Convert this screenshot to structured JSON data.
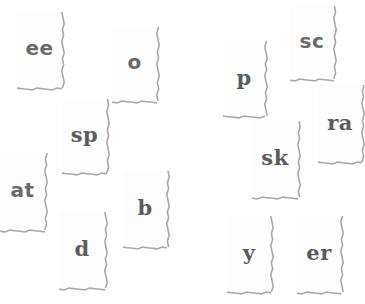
{
  "game": {
    "type": "word-fragment tiles",
    "tile_count": 13
  },
  "tiles": [
    {
      "id": "ee",
      "text": "ee",
      "x": 17,
      "y": 12,
      "w": 45,
      "h": 76
    },
    {
      "id": "o",
      "text": "o",
      "x": 112,
      "y": 27,
      "w": 45,
      "h": 74
    },
    {
      "id": "sp",
      "text": "sp",
      "x": 62,
      "y": 99,
      "w": 45,
      "h": 74
    },
    {
      "id": "at",
      "text": "at",
      "x": 0,
      "y": 153,
      "w": 45,
      "h": 77
    },
    {
      "id": "b",
      "text": "b",
      "x": 123,
      "y": 171,
      "w": 44,
      "h": 76
    },
    {
      "id": "d",
      "text": "d",
      "x": 59,
      "y": 212,
      "w": 46,
      "h": 76
    },
    {
      "id": "p",
      "text": "p",
      "x": 223,
      "y": 41,
      "w": 42,
      "h": 75
    },
    {
      "id": "sc",
      "text": "sc",
      "x": 290,
      "y": 6,
      "w": 44,
      "h": 73
    },
    {
      "id": "ra",
      "text": "ra",
      "x": 318,
      "y": 85,
      "w": 44,
      "h": 77
    },
    {
      "id": "sk",
      "text": "sk",
      "x": 252,
      "y": 121,
      "w": 46,
      "h": 76
    },
    {
      "id": "y",
      "text": "y",
      "x": 227,
      "y": 216,
      "w": 44,
      "h": 76
    },
    {
      "id": "er",
      "text": "er",
      "x": 297,
      "y": 216,
      "w": 44,
      "h": 76
    }
  ],
  "colors": {
    "background": "#ffffff",
    "tile": "#fdfdfd",
    "edge_shadow": "#a8a8a8",
    "text": "#5c5c5c"
  }
}
